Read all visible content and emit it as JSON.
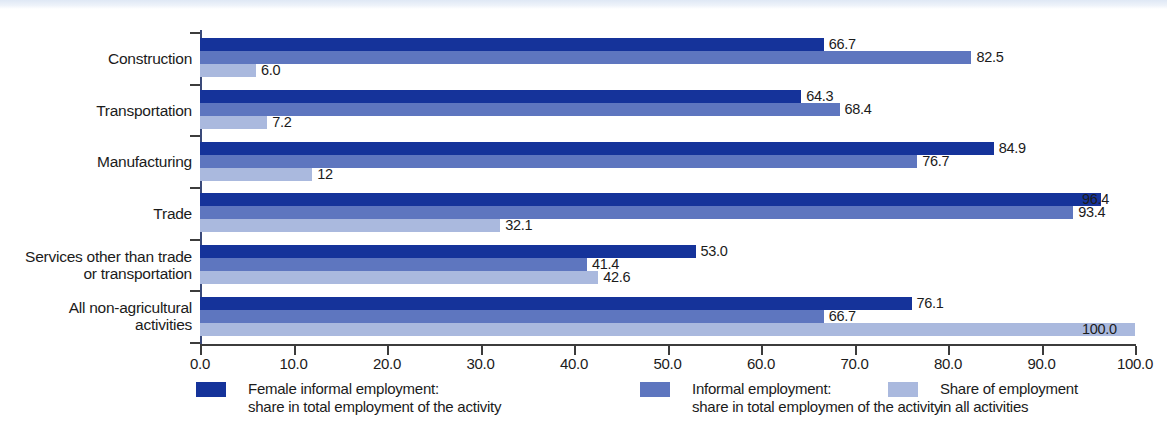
{
  "chart_data": {
    "type": "bar",
    "orientation": "horizontal",
    "title": "",
    "xlabel": "",
    "ylabel": "",
    "xlim": [
      0,
      100
    ],
    "xticks": [
      "0.0",
      "10.0",
      "20.0",
      "30.0",
      "40.0",
      "50.0",
      "60.0",
      "70.0",
      "80.0",
      "90.0",
      "100.0"
    ],
    "xtick_values": [
      0,
      10,
      20,
      30,
      40,
      50,
      60,
      70,
      80,
      90,
      100
    ],
    "grid": false,
    "legend_position": "bottom",
    "categories": [
      "Construction",
      "Transportation",
      "Manufacturing",
      "Trade",
      "Services other than trade or transportation",
      "All non-agricultural activities"
    ],
    "category_lines": [
      [
        "Construction"
      ],
      [
        "Transportation"
      ],
      [
        "Manufacturing"
      ],
      [
        "Trade"
      ],
      [
        "Services other than trade",
        "or transportation"
      ],
      [
        "All non-agricultural",
        "activities"
      ]
    ],
    "series": [
      {
        "name": "Female informal employment: share in total employment of the activity",
        "name_lines": [
          "Female informal employment:",
          "share in total employment of the activity"
        ],
        "color": "#15339a",
        "values": [
          66.7,
          64.3,
          84.9,
          96.4,
          53.0,
          76.1
        ],
        "labels": [
          "66.7",
          "64.3",
          "84.9",
          "96.4",
          "53.0",
          "76.1"
        ]
      },
      {
        "name": "Informal employment: share in total employmen of the activity",
        "name_lines": [
          "Informal employment:",
          "share in total employmen of the activity"
        ],
        "color": "#5e76bf",
        "values": [
          82.5,
          68.4,
          76.7,
          93.4,
          41.4,
          66.7
        ],
        "labels": [
          "82.5",
          "68.4",
          "76.7",
          "93.4",
          "41.4",
          "66.7"
        ]
      },
      {
        "name": "Share of employment in all activities",
        "name_lines": [
          "Share of employment",
          "in all activities"
        ],
        "color": "#aab9de",
        "values": [
          6.0,
          7.2,
          12.0,
          32.1,
          42.6,
          100.0
        ],
        "labels": [
          "6.0",
          "7.2",
          "12",
          "32.1",
          "42.6",
          "100.0"
        ]
      }
    ]
  },
  "colors": {
    "series_0": "#15339a",
    "series_1": "#5e76bf",
    "series_2": "#aab9de",
    "axis": "#3c3c3c",
    "text": "#1b1b1b",
    "background": "#ffffff"
  }
}
